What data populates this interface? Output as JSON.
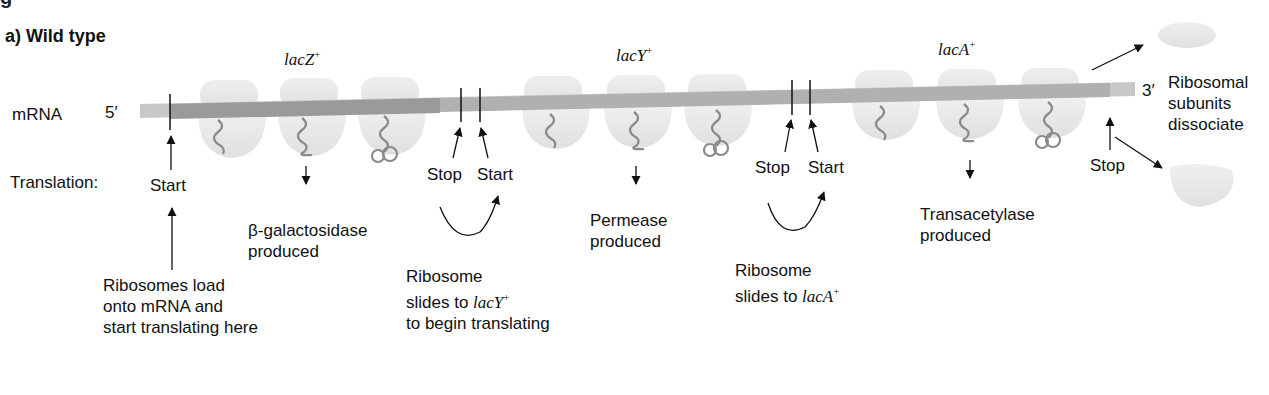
{
  "figure": {
    "top_fragment": "g",
    "panel_label": "a) Wild type",
    "row_labels": {
      "mrna": "mRNA",
      "translation": "Translation:"
    },
    "ends": {
      "five_prime": "5′",
      "three_prime": "3′"
    },
    "genes": [
      {
        "name": "lacZ",
        "sup": "+"
      },
      {
        "name": "lacY",
        "sup": "+"
      },
      {
        "name": "lacA",
        "sup": "+"
      }
    ],
    "markers": {
      "start1": "Start",
      "stop1": "Stop",
      "start2": "Start",
      "stop2": "Stop",
      "start3": "Start",
      "stop3": "Stop"
    },
    "products": {
      "p1_line1": "β-galactosidase",
      "p1_line2": "produced",
      "p2_line1": "Permease",
      "p2_line2": "produced",
      "p3_line1": "Transacetylase",
      "p3_line2": "produced"
    },
    "notes": {
      "load_l1": "Ribosomes load",
      "load_l2": "onto mRNA and",
      "load_l3": "start translating here",
      "slideY_l1": "Ribosome",
      "slideY_l2": "slides to ",
      "slideY_gene": "lacY",
      "slideY_sup": "+",
      "slideY_l3": "to begin translating",
      "slideA_l1": "Ribosome",
      "slideA_l2": "slides to ",
      "slideA_gene": "lacA",
      "slideA_sup": "+",
      "dissociate_l1": "Ribosomal",
      "dissociate_l2": "subunits",
      "dissociate_l3": "dissociate"
    },
    "colors": {
      "mrna_dark": "#9a9a9a",
      "mrna_light": "#c8c8c8",
      "ribosome": "#e6e6e6",
      "polypeptide": "#8a8a8a",
      "ink": "#111111"
    }
  }
}
